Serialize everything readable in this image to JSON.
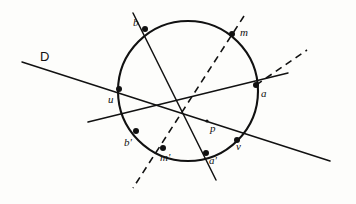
{
  "figure": {
    "background_color": "#fdfdfb",
    "ink_color": "#111111",
    "width": 356,
    "height": 204
  },
  "circle": {
    "name": "main-circle",
    "cx": 188,
    "cy": 91,
    "r": 70
  },
  "points": [
    {
      "id": "b",
      "label": "b",
      "x": 145,
      "y": 29,
      "lx": 133,
      "ly": 17,
      "on_circle": true
    },
    {
      "id": "m",
      "label": "m",
      "x": 232,
      "y": 34,
      "lx": 240,
      "ly": 27,
      "on_circle": true
    },
    {
      "id": "u",
      "label": "u",
      "x": 119,
      "y": 89,
      "lx": 108,
      "ly": 94,
      "on_circle": true
    },
    {
      "id": "a",
      "label": "a",
      "x": 256,
      "y": 85,
      "lx": 261,
      "ly": 88,
      "on_circle": true
    },
    {
      "id": "bprime",
      "label": "b'",
      "x": 136,
      "y": 131,
      "lx": 124,
      "ly": 137,
      "on_circle": true
    },
    {
      "id": "mprime",
      "label": "m'",
      "x": 163,
      "y": 148,
      "lx": 160,
      "ly": 152,
      "on_circle": true
    },
    {
      "id": "aprime",
      "label": "a'",
      "x": 206,
      "y": 153,
      "lx": 209,
      "ly": 155,
      "on_circle": true
    },
    {
      "id": "v",
      "label": "v",
      "x": 237,
      "y": 140,
      "lx": 236,
      "ly": 141,
      "on_circle": true
    },
    {
      "id": "p",
      "label": "p",
      "x": 207,
      "y": 121,
      "lx": 210,
      "ly": 123,
      "on_circle": false
    }
  ],
  "line_labels": [
    {
      "id": "D",
      "label": "D",
      "lx": 40,
      "ly": 50
    }
  ],
  "solid_lines": [
    {
      "id": "line-D-u-a-v",
      "x1": 22,
      "y1": 62,
      "x2": 330,
      "y2": 161
    },
    {
      "id": "chord-b-aprime",
      "x1": 133,
      "y1": 13,
      "x2": 216,
      "y2": 180
    },
    {
      "id": "line-bprime-a-ext",
      "x1": 88,
      "y1": 122,
      "x2": 288,
      "y2": 73
    }
  ],
  "dashed_lines": [
    {
      "id": "dashed-m-mprime-ext",
      "x1": 244,
      "y1": 16,
      "x2": 133,
      "y2": 188
    },
    {
      "id": "dashed-a-tangent",
      "x1": 256,
      "y1": 85,
      "x2": 307,
      "y2": 50
    }
  ],
  "interactables": {
    "figure_clickable": "false"
  }
}
